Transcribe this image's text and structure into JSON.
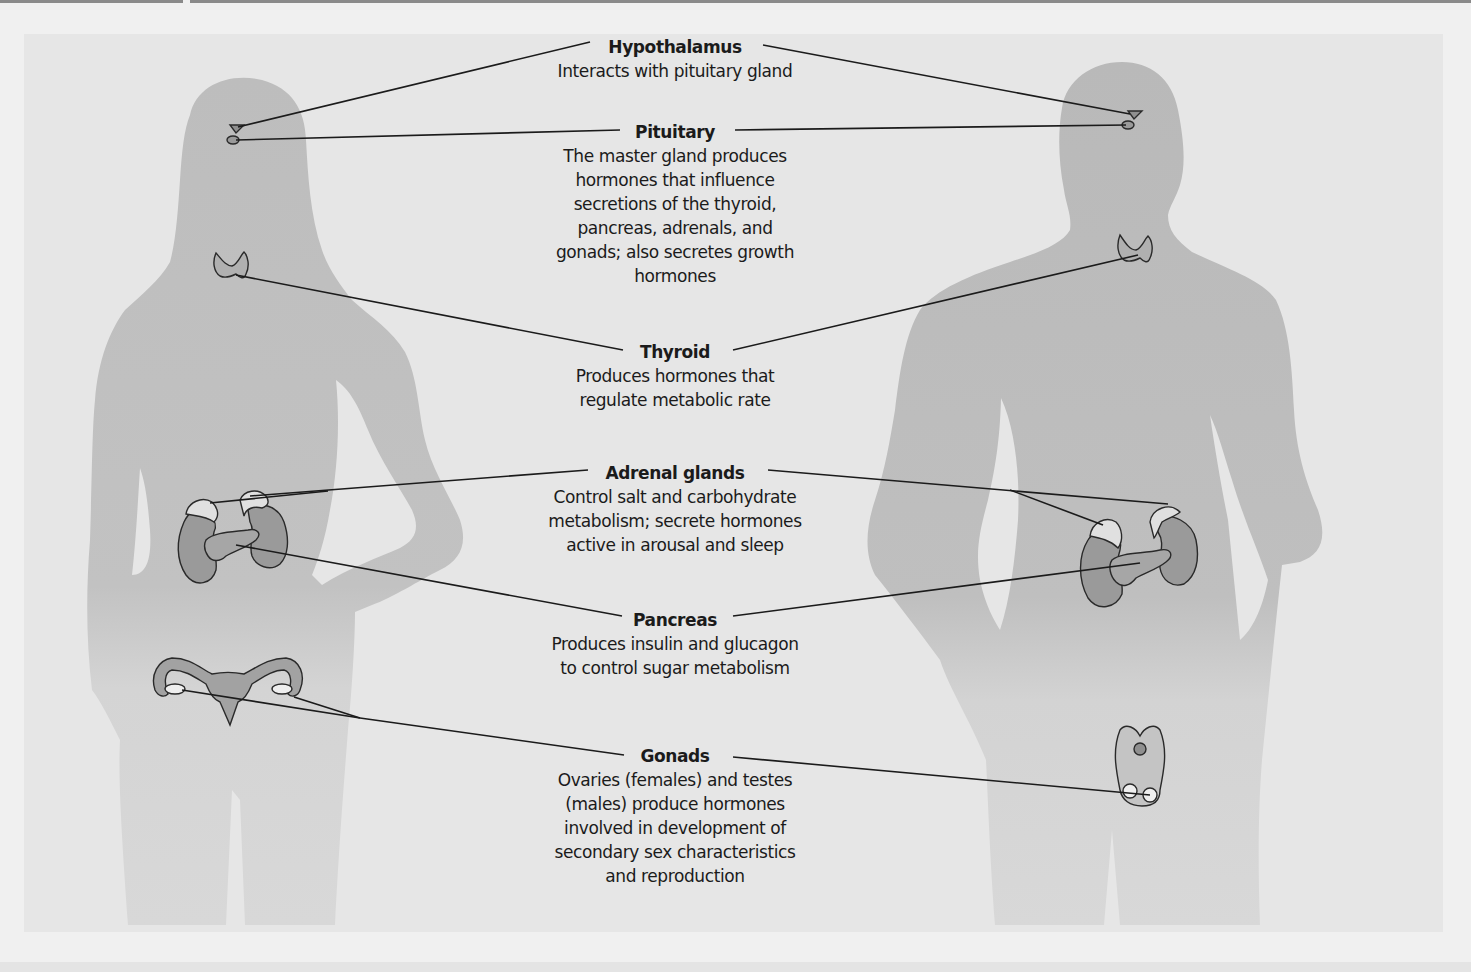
{
  "figure": {
    "figures": [
      "female-silhouette",
      "male-silhouette"
    ],
    "colors": {
      "page": "#f0f0f0",
      "figure_background": "#e6e6e6",
      "silhouette_upper": "#bdbdbd",
      "silhouette_lower": "#d6d6d6",
      "organ_fill": "#9a9a9a",
      "adrenal_fill": "#e2e2e2",
      "leader_line": "#1b1b1b"
    }
  },
  "labels": [
    {
      "id": "hypothalamus",
      "title": "Hypothalamus",
      "description": "Interacts with pituitary gland"
    },
    {
      "id": "pituitary",
      "title": "Pituitary",
      "description": "The master gland produces\nhormones that influence\nsecretions of the thyroid,\npancreas, adrenals, and\ngonads; also secretes growth\nhormones"
    },
    {
      "id": "thyroid",
      "title": "Thyroid",
      "description": "Produces hormones that\nregulate metabolic rate"
    },
    {
      "id": "adrenal",
      "title": "Adrenal glands",
      "description": "Control salt and carbohydrate\nmetabolism; secrete hormones\nactive in arousal and sleep"
    },
    {
      "id": "pancreas",
      "title": "Pancreas",
      "description": "Produces insulin and glucagon\nto control sugar metabolism"
    },
    {
      "id": "gonads",
      "title": "Gonads",
      "description": "Ovaries (females) and testes\n(males) produce hormones\ninvolved in development of\nsecondary sex characteristics\nand reproduction"
    }
  ]
}
